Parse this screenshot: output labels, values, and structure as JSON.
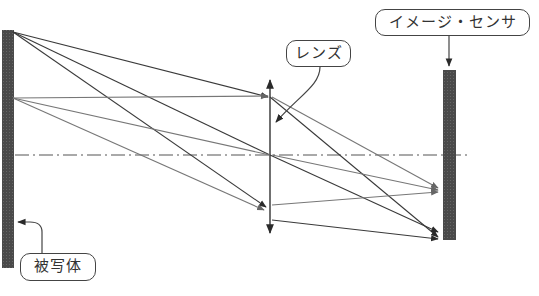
{
  "labels": {
    "lens": "レンズ",
    "sensor": "イメージ・センサ",
    "object": "被写体"
  },
  "colors": {
    "bar_fill": "#4a4a4a",
    "ray_dark": "#3a3a3a",
    "ray_light": "#777777",
    "axis": "#555555",
    "label_border": "#444444",
    "background": "#ffffff"
  },
  "geometry": {
    "object_bar": {
      "x": 2,
      "y": 30,
      "width": 12,
      "height": 238
    },
    "sensor_bar": {
      "x": 443,
      "y": 70,
      "width": 13,
      "height": 170
    },
    "lens_x": 270,
    "lens_top": 78,
    "lens_bottom": 235,
    "optical_axis_y": 155
  }
}
